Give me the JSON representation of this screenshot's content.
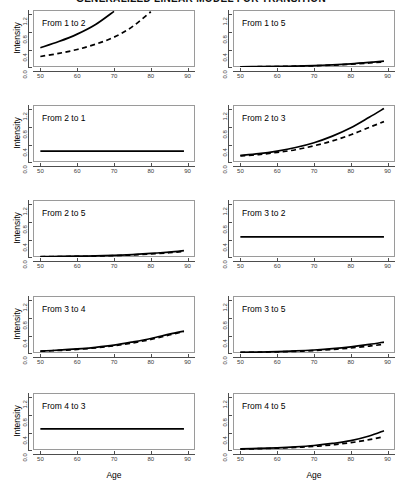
{
  "figure": {
    "title": "GENERALIZED LINEAR MODEL FOR TRANSITION",
    "y_axis_title": "Intensity",
    "x_axis_title": "Age",
    "x_ticks": [
      "50",
      "60",
      "70",
      "80",
      "90"
    ],
    "y_ticks": [
      "0.0",
      "0.4",
      "0.8",
      "1.2"
    ],
    "line_color": "#000000",
    "panel_border_color": "#9a9a9a",
    "axis_color": "#4d4d4d",
    "background": "#ffffff"
  },
  "chart_data": {
    "type": "line",
    "title": "GENERALIZED LINEAR MODEL FOR TRANSITION",
    "xlabel": "Age",
    "ylabel": "Intensity",
    "xlim": [
      48,
      92
    ],
    "ylim": [
      0.0,
      1.3
    ],
    "xticks": [
      50,
      60,
      70,
      80,
      90
    ],
    "yticks": [
      0.0,
      0.4,
      0.8,
      1.2
    ],
    "grid": false,
    "legend": "none",
    "layout": {
      "rows": 5,
      "cols": 2,
      "order": "row-major"
    },
    "x": [
      50,
      55,
      60,
      65,
      70,
      75,
      80,
      85,
      89
    ],
    "panels": [
      {
        "label": "From 1 to 2",
        "row": 1,
        "col": 1,
        "series": [
          {
            "name": "solid",
            "style": "solid",
            "values": [
              0.44,
              0.58,
              0.75,
              0.97,
              1.27,
              null,
              null,
              null,
              null
            ]
          },
          {
            "name": "dashed",
            "style": "dashed",
            "values": [
              0.24,
              0.31,
              0.4,
              0.52,
              0.68,
              0.92,
              1.26,
              null,
              null
            ]
          }
        ]
      },
      {
        "label": "From 1 to 5",
        "row": 1,
        "col": 2,
        "series": [
          {
            "name": "solid",
            "style": "solid",
            "values": [
              0.005,
              0.008,
              0.013,
              0.021,
              0.033,
              0.05,
              0.073,
              0.105,
              0.135
            ]
          },
          {
            "name": "dashed",
            "style": "dashed",
            "values": [
              0.004,
              0.007,
              0.011,
              0.018,
              0.028,
              0.043,
              0.064,
              0.092,
              0.118
            ]
          }
        ]
      },
      {
        "label": "From 2 to 1",
        "row": 2,
        "col": 1,
        "series": [
          {
            "name": "solid",
            "style": "solid",
            "values": [
              0.25,
              0.25,
              0.25,
              0.25,
              0.25,
              0.25,
              0.25,
              0.25,
              0.25
            ]
          }
        ]
      },
      {
        "label": "From 2 to 3",
        "row": 2,
        "col": 2,
        "series": [
          {
            "name": "solid",
            "style": "solid",
            "values": [
              0.15,
              0.19,
              0.25,
              0.33,
              0.44,
              0.59,
              0.78,
              1.02,
              1.22
            ]
          },
          {
            "name": "dashed",
            "style": "dashed",
            "values": [
              0.14,
              0.17,
              0.22,
              0.28,
              0.37,
              0.48,
              0.62,
              0.79,
              0.92
            ]
          }
        ]
      },
      {
        "label": "From 2 to 5",
        "row": 3,
        "col": 1,
        "series": [
          {
            "name": "solid",
            "style": "solid",
            "values": [
              0.008,
              0.012,
              0.018,
              0.026,
              0.038,
              0.056,
              0.081,
              0.113,
              0.145
            ]
          },
          {
            "name": "dashed",
            "style": "dashed",
            "values": [
              0.006,
              0.009,
              0.014,
              0.021,
              0.032,
              0.047,
              0.069,
              0.098,
              0.126
            ]
          }
        ]
      },
      {
        "label": "From 3 to 2",
        "row": 3,
        "col": 2,
        "series": [
          {
            "name": "solid",
            "style": "solid",
            "values": [
              0.46,
              0.46,
              0.46,
              0.46,
              0.46,
              0.46,
              0.46,
              0.46,
              0.46
            ]
          }
        ]
      },
      {
        "label": "From 3 to 4",
        "row": 4,
        "col": 1,
        "series": [
          {
            "name": "solid",
            "style": "solid",
            "values": [
              0.045,
              0.065,
              0.092,
              0.13,
              0.18,
              0.25,
              0.33,
              0.43,
              0.5
            ]
          },
          {
            "name": "dashed",
            "style": "dashed",
            "values": [
              0.04,
              0.058,
              0.083,
              0.118,
              0.165,
              0.228,
              0.31,
              0.41,
              0.49
            ]
          }
        ]
      },
      {
        "label": "From 3 to 5",
        "row": 4,
        "col": 2,
        "series": [
          {
            "name": "solid",
            "style": "solid",
            "values": [
              0.015,
              0.022,
              0.032,
              0.047,
              0.068,
              0.098,
              0.14,
              0.195,
              0.25
            ]
          },
          {
            "name": "dashed",
            "style": "dashed",
            "values": [
              0.012,
              0.018,
              0.026,
              0.038,
              0.055,
              0.08,
              0.114,
              0.158,
              0.2
            ]
          }
        ]
      },
      {
        "label": "From 4 to 3",
        "row": 5,
        "col": 1,
        "series": [
          {
            "name": "solid",
            "style": "solid",
            "values": [
              0.48,
              0.48,
              0.48,
              0.48,
              0.48,
              0.48,
              0.48,
              0.48,
              0.48
            ]
          }
        ]
      },
      {
        "label": "From 4 to 5",
        "row": 5,
        "col": 2,
        "series": [
          {
            "name": "solid",
            "style": "solid",
            "values": [
              0.025,
              0.035,
              0.05,
              0.072,
              0.103,
              0.15,
              0.215,
              0.32,
              0.44
            ]
          },
          {
            "name": "dashed",
            "style": "dashed",
            "values": [
              0.022,
              0.03,
              0.042,
              0.059,
              0.083,
              0.118,
              0.167,
              0.236,
              0.305
            ]
          }
        ]
      }
    ]
  }
}
